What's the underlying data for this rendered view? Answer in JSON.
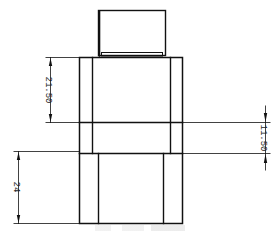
{
  "drawing": {
    "type": "technical-elevation",
    "line_color": "#111111",
    "background": "#ffffff"
  },
  "dimensions": {
    "upper_left": {
      "label": "21.50",
      "orientation": "vertical"
    },
    "middle_right": {
      "label": "11.50",
      "orientation": "vertical"
    },
    "lower_left": {
      "label": "24",
      "orientation": "vertical"
    }
  },
  "caption": {
    "text": ""
  }
}
